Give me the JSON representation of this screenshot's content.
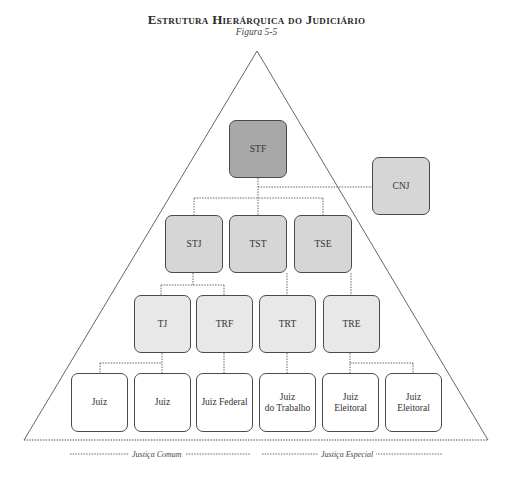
{
  "header": {
    "title": "Estrutura Hierárquica do Judiciário",
    "subtitle": "Figura 5-5"
  },
  "levels": {
    "top": [
      {
        "label": "STF"
      }
    ],
    "council": [
      {
        "label": "CNJ"
      }
    ],
    "superior": [
      {
        "label": "STJ"
      },
      {
        "label": "TST"
      },
      {
        "label": "TSE"
      }
    ],
    "second": [
      {
        "label": "TJ"
      },
      {
        "label": "TRF"
      },
      {
        "label": "TRT"
      },
      {
        "label": "TRE"
      }
    ],
    "first": [
      {
        "label": "Juiz"
      },
      {
        "label": "Juiz"
      },
      {
        "label": "Juiz Federal"
      },
      {
        "label": "Juiz\ndo Trabalho"
      },
      {
        "label": "Juiz\nEleitoral"
      },
      {
        "label": "Juiz\nEleitoral"
      }
    ]
  },
  "footer": {
    "left_label": "Justiça Comum",
    "right_label": "Justiça Especial"
  },
  "colors": {
    "top_fill": "#a8a8a8",
    "council_fill": "#d6d6d6",
    "superior_fill": "#d6d6d6",
    "second_fill": "#e8e8e8",
    "first_fill": "#ffffff"
  }
}
